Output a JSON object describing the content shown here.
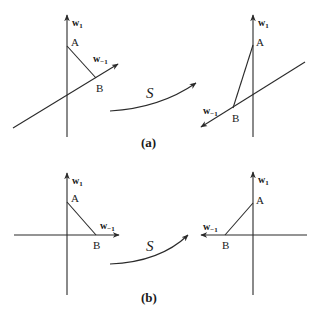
{
  "figure": {
    "transform_label": "S",
    "panels": [
      {
        "caption": "(a)",
        "before": {
          "axis_v": "w",
          "axis_v_sub": "1",
          "axis_o": "w",
          "axis_o_sub": "−1",
          "point_a": "A",
          "point_b": "B"
        },
        "after": {
          "axis_v": "w",
          "axis_v_sub": "1",
          "axis_o": "w",
          "axis_o_sub": "−1",
          "point_a": "A",
          "point_b": "B"
        }
      },
      {
        "caption": "(b)",
        "before": {
          "axis_v": "w",
          "axis_v_sub": "1",
          "axis_o": "w",
          "axis_o_sub": "−1",
          "point_a": "A",
          "point_b": "B"
        },
        "after": {
          "axis_v": "w",
          "axis_v_sub": "1",
          "axis_o": "w",
          "axis_o_sub": "−1",
          "point_a": "A",
          "point_b": "B"
        }
      }
    ]
  }
}
